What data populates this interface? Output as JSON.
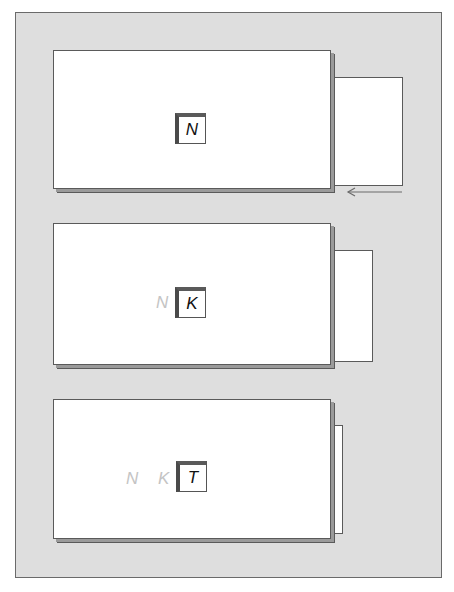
{
  "diagram": {
    "background_color": "#dedede",
    "panels": [
      {
        "id": "panel-1",
        "current_letter": "N",
        "previous_letters": [],
        "side_sheet_width": "large",
        "has_arrow": true,
        "arrow_direction": "left"
      },
      {
        "id": "panel-2",
        "current_letter": "K",
        "previous_letters": [
          "N"
        ],
        "side_sheet_width": "medium",
        "has_arrow": false
      },
      {
        "id": "panel-3",
        "current_letter": "T",
        "previous_letters": [
          "N",
          "K"
        ],
        "side_sheet_width": "small",
        "has_arrow": false
      }
    ]
  },
  "p1": {
    "letter": "N"
  },
  "p2": {
    "letter": "K",
    "ghost": [
      "N"
    ]
  },
  "p3": {
    "letter": "T",
    "ghost": [
      "N",
      "K"
    ]
  }
}
